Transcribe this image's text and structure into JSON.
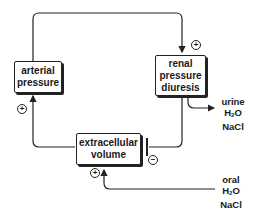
{
  "nodes": {
    "arterial_pressure": {
      "line1": "arterial",
      "line2": "pressure"
    },
    "renal_pressure_diuresis": {
      "line1": "renal",
      "line2": "pressure",
      "line3": "diuresis"
    },
    "extracellular_volume": {
      "line1": "extracellular",
      "line2": "volume"
    }
  },
  "outputs": {
    "urine": {
      "line1": "urine",
      "h2o_base": "H",
      "h2o_sub": "2",
      "h2o_tail": "O",
      "line3": "NaCl"
    },
    "oral": {
      "line1": "oral",
      "h2o_base": "H",
      "h2o_sub": "2",
      "h2o_tail": "O",
      "line3": "NaCl"
    }
  },
  "signs": {
    "renal_input": "+",
    "arterial_input": "+",
    "extracellular_input": "+",
    "extracellular_inhibit": "−"
  }
}
